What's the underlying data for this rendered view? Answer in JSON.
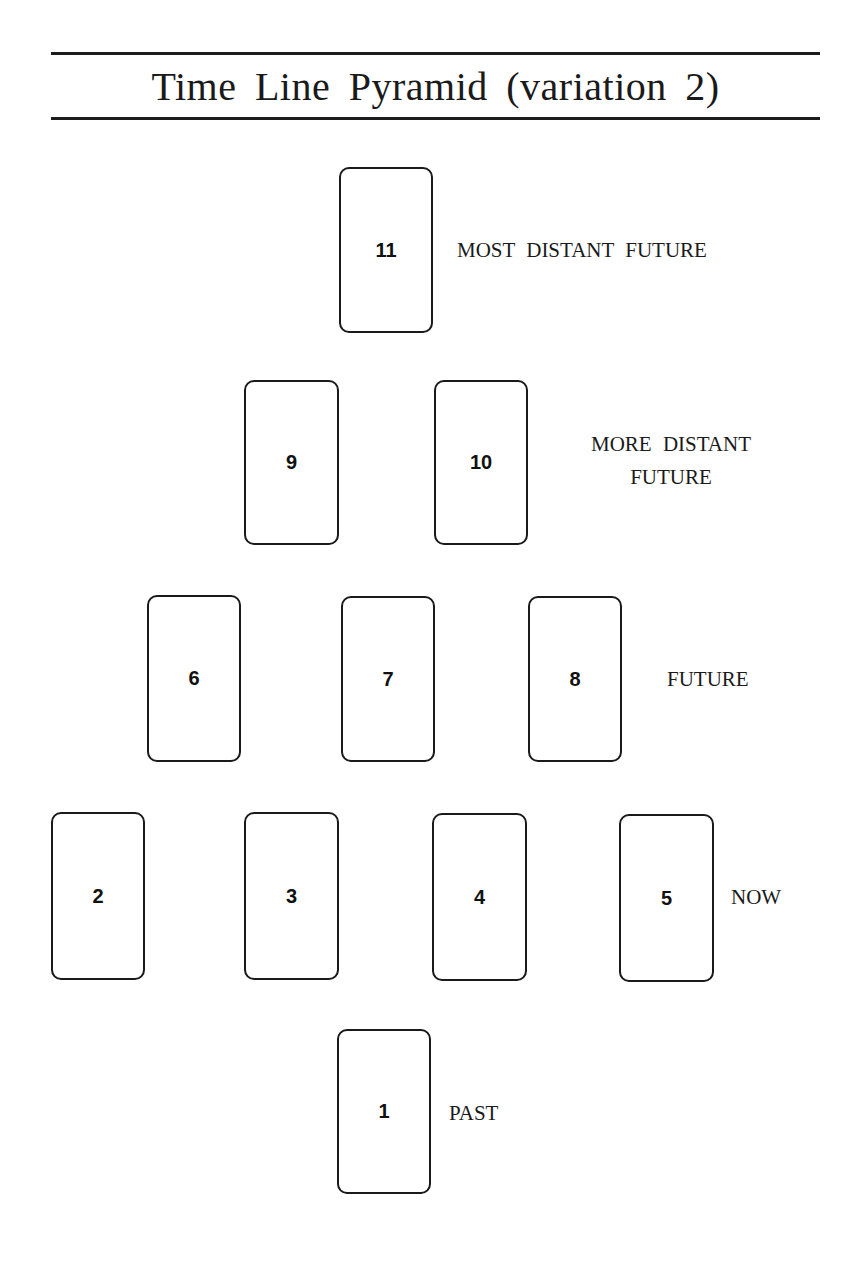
{
  "title": "Time Line Pyramid (variation 2)",
  "cards": [
    {
      "number": "11",
      "row": 1
    },
    {
      "number": "9",
      "row": 2
    },
    {
      "number": "10",
      "row": 2
    },
    {
      "number": "6",
      "row": 3
    },
    {
      "number": "7",
      "row": 3
    },
    {
      "number": "8",
      "row": 3
    },
    {
      "number": "2",
      "row": 4
    },
    {
      "number": "3",
      "row": 4
    },
    {
      "number": "4",
      "row": 4
    },
    {
      "number": "5",
      "row": 4
    },
    {
      "number": "1",
      "row": 5
    }
  ],
  "labels": {
    "row1": "MOST DISTANT FUTURE",
    "row2_line1": "MORE DISTANT",
    "row2_line2": "FUTURE",
    "row3": "FUTURE",
    "row4": "NOW",
    "row5": "PAST"
  }
}
